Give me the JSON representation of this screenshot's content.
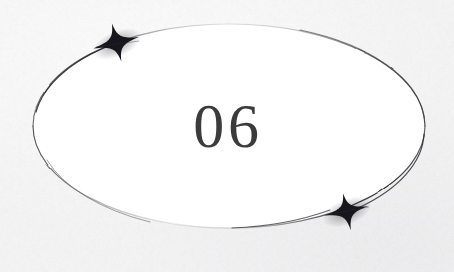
{
  "canvas": {
    "width": 454,
    "height": 272,
    "background_color": "#f6f6f7",
    "paper_texture": "grain"
  },
  "artwork": {
    "title": "06",
    "style": "hand-drawn ink ellipse with sparkle ornaments",
    "ellipse": {
      "name": "ellipse-outline",
      "center_x": 229,
      "center_y": 126,
      "radius_x": 196,
      "radius_y": 102,
      "fill_color": "#ffffff",
      "stroke_color": "#2b2b2f",
      "stroke_width": 1.1,
      "stroke_style": "uneven hand-drawn, fading at top-center and bottom-center"
    },
    "number": {
      "name": "number-text",
      "value": "06",
      "color": "#3b3b3d",
      "font_size_px": 62,
      "typeface_style": "serif",
      "center_x": 229,
      "center_y": 117
    },
    "ornaments": [
      {
        "name": "sparkle-star-top-left",
        "icon": "four-pointed-star-icon",
        "center_x": 117,
        "center_y": 44,
        "radius_long": 22,
        "radius_short": 7,
        "rotation_deg": -12,
        "color": "#1a1a1e"
      },
      {
        "name": "sparkle-star-bottom-right",
        "icon": "four-pointed-star-icon",
        "center_x": 347,
        "center_y": 212,
        "radius_long": 22,
        "radius_short": 7,
        "rotation_deg": -12,
        "color": "#1a1a1e"
      }
    ]
  }
}
